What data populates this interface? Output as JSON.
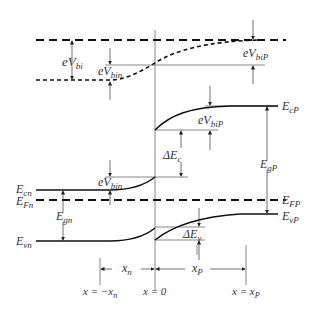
{
  "diagram": {
    "type": "heterojunction-energy-band-diagram",
    "labels": {
      "eVbi": "eV",
      "eVbi_sub": "bi",
      "eVbin": "eV",
      "eVbin_sub": "bin",
      "eVbiP": "eV",
      "eVbiP_sub": "biP",
      "Ecn": "E",
      "Ecn_sub": "cn",
      "EFn": "E",
      "EFn_sub": "Fn",
      "Egn": "E",
      "Egn_sub": "gn",
      "Evn": "E",
      "Evn_sub": "vn",
      "EcP": "E",
      "EcP_sub": "cP",
      "EFP": "E",
      "EFP_sub": "FP",
      "EgP": "E",
      "EgP_sub": "gP",
      "EvP": "E",
      "EvP_sub": "vP",
      "dEc": "ΔE",
      "dEc_sub": "c",
      "dEv": "ΔE",
      "dEv_sub": "v",
      "xn": "x",
      "xn_sub": "n",
      "xp": "x",
      "xp_sub": "P"
    },
    "axis_labels": {
      "left": "x = −x",
      "left_sub": "n",
      "center": "x = 0",
      "right": "x = x",
      "right_sub": "P"
    }
  }
}
